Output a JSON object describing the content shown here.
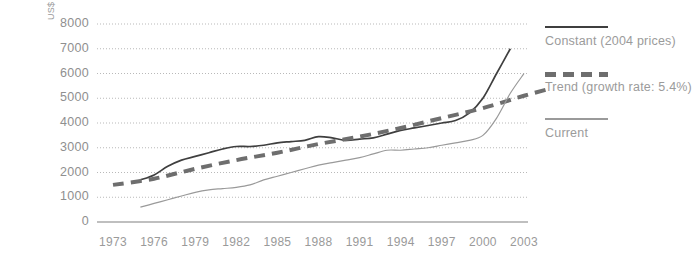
{
  "chart_data": {
    "type": "line",
    "title": "",
    "xlabel": "",
    "ylabel": "US$ million",
    "xlim": [
      1973,
      2005
    ],
    "ylim": [
      0,
      8000
    ],
    "grid": true,
    "legend_position": "right",
    "x_ticks": [
      "1973",
      "1976",
      "1979",
      "1982",
      "1985",
      "1988",
      "1991",
      "1994",
      "1997",
      "2000",
      "2003"
    ],
    "y_ticks": [
      "0",
      "1000",
      "2000",
      "3000",
      "4000",
      "5000",
      "6000",
      "7000",
      "8000"
    ],
    "series": [
      {
        "name": "Constant (2004 prices)",
        "style": "solid",
        "color": "#3f3f3f",
        "x": [
          1975,
          1976,
          1977,
          1978,
          1979,
          1980,
          1981,
          1982,
          1983,
          1984,
          1985,
          1986,
          1987,
          1988,
          1989,
          1990,
          1991,
          1992,
          1993,
          1994,
          1995,
          1996,
          1997,
          1998,
          1999,
          2000,
          2001,
          2002
        ],
        "values": [
          1700,
          1900,
          2250,
          2500,
          2650,
          2800,
          2950,
          3050,
          3050,
          3100,
          3200,
          3250,
          3300,
          3450,
          3400,
          3300,
          3350,
          3400,
          3550,
          3700,
          3800,
          3900,
          4000,
          4100,
          4400,
          5000,
          6000,
          7000
        ]
      },
      {
        "name": "Trend (growth rate: 5.4%)",
        "style": "dashed",
        "color": "#6e6e6e",
        "x": [
          1973,
          1976,
          1979,
          1982,
          1985,
          1988,
          1991,
          1994,
          1997,
          2000,
          2003,
          2005
        ],
        "values": [
          1500,
          1750,
          2150,
          2500,
          2800,
          3150,
          3450,
          3800,
          4200,
          4600,
          5100,
          5400
        ]
      },
      {
        "name": "Current",
        "style": "solid-thin",
        "color": "#9a9a9a",
        "x": [
          1975,
          1976,
          1977,
          1978,
          1979,
          1980,
          1981,
          1982,
          1983,
          1984,
          1985,
          1986,
          1987,
          1988,
          1989,
          1990,
          1991,
          1992,
          1993,
          1994,
          1995,
          1996,
          1997,
          1998,
          1999,
          2000,
          2001,
          2002,
          2003
        ],
        "values": [
          600,
          750,
          900,
          1050,
          1200,
          1300,
          1350,
          1400,
          1500,
          1700,
          1850,
          2000,
          2150,
          2300,
          2400,
          2500,
          2600,
          2750,
          2900,
          2900,
          2950,
          3000,
          3100,
          3200,
          3300,
          3500,
          4200,
          5200,
          6000
        ]
      }
    ]
  },
  "legend": {
    "items": [
      {
        "label": "Constant (2004 prices)"
      },
      {
        "label": "Trend (growth rate: 5.4%)"
      },
      {
        "label": "Current"
      }
    ]
  },
  "colors": {
    "constant": "#3f3f3f",
    "trend": "#6e6e6e",
    "current": "#9a9a9a",
    "grid": "#b9b9b9",
    "axis": "#aaaaaa",
    "text": "#9a9a9a"
  }
}
